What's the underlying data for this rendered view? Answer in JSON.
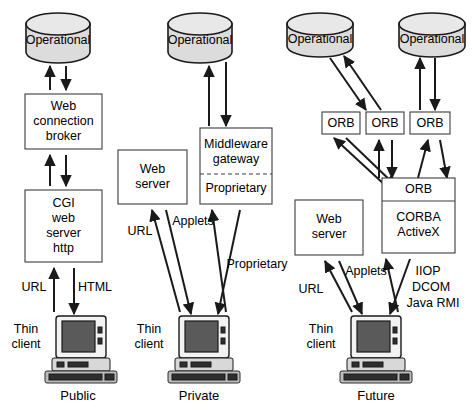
{
  "diagram": {
    "columns": [
      {
        "id": "public",
        "caption": "Public",
        "client_label_line1": "Thin",
        "client_label_line2": "client",
        "datastore": "Operational",
        "nodes": [
          {
            "id": "web-connection-broker",
            "lines": [
              "Web",
              "connection",
              "broker"
            ]
          },
          {
            "id": "cgi-web-server-http",
            "lines": [
              "CGI",
              "web",
              "server",
              "http"
            ]
          }
        ],
        "edge_labels": [
          "URL",
          "HTML"
        ]
      },
      {
        "id": "private",
        "caption": "Private",
        "client_label_line1": "Thin",
        "client_label_line2": "client",
        "datastore": "Operational",
        "nodes": [
          {
            "id": "web-server",
            "lines": [
              "Web",
              "server"
            ]
          },
          {
            "id": "middleware-gateway",
            "lines": [
              "Middleware",
              "gateway"
            ],
            "sub_lines": [
              "Proprietary"
            ],
            "divider": "dashed"
          }
        ],
        "edge_labels": [
          "URL",
          "Applets",
          "Proprietary"
        ]
      },
      {
        "id": "future",
        "caption": "Future",
        "client_label_line1": "Thin",
        "client_label_line2": "client",
        "datastores": [
          "Operational",
          "Operational"
        ],
        "orb_row": [
          "ORB",
          "ORB",
          "ORB"
        ],
        "nodes": [
          {
            "id": "web-server",
            "lines": [
              "Web",
              "server"
            ]
          },
          {
            "id": "orb-corba-activex",
            "lines": [
              "ORB"
            ],
            "sub_lines": [
              "CORBA",
              "ActiveX"
            ],
            "divider": "solid"
          }
        ],
        "edge_labels": [
          "URL",
          "Applets",
          "IIOP",
          "DCOM",
          "Java RMI"
        ]
      }
    ],
    "colors": {
      "background": "#ffffff",
      "stroke": "#1a1a1a",
      "box_stroke": "#3c3c3c",
      "cylinder_fill": "#dcdcdc",
      "cylinder_top_fill": "#e8e8e8",
      "screen_fill": "#5a5a5a"
    }
  }
}
